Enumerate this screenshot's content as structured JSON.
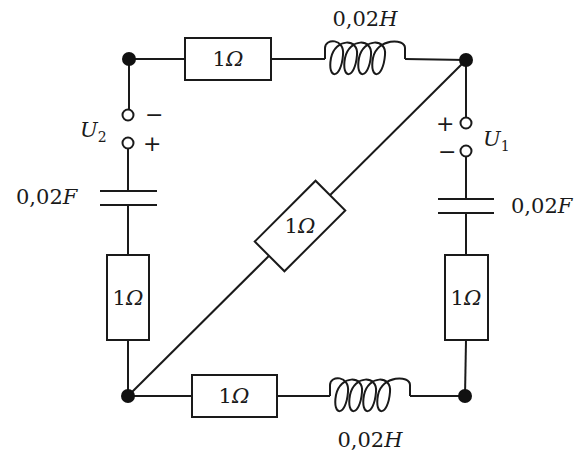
{
  "diagram": {
    "type": "electrical-circuit",
    "nodes": [
      {
        "id": "top-left",
        "x": 129,
        "y": 59
      },
      {
        "id": "top-right",
        "x": 466,
        "y": 60
      },
      {
        "id": "bottom-left",
        "x": 128,
        "y": 396
      },
      {
        "id": "bottom-right",
        "x": 465,
        "y": 396
      }
    ],
    "top_branch": {
      "resistor": {
        "value": "1",
        "unit": "Ω"
      },
      "inductor": {
        "label": "0,02",
        "unit": "H"
      }
    },
    "bottom_branch": {
      "resistor": {
        "value": "1",
        "unit": "Ω"
      },
      "inductor": {
        "label": "0,02",
        "unit": "H"
      }
    },
    "left_branch": {
      "source": {
        "name": "U",
        "sub": "2",
        "top_sign": "−",
        "bottom_sign": "+"
      },
      "capacitor": {
        "label": "0,02",
        "unit": "F"
      },
      "resistor": {
        "value": "1",
        "unit": "Ω"
      }
    },
    "right_branch": {
      "source": {
        "name": "U",
        "sub": "1",
        "top_sign": "+",
        "bottom_sign": "−"
      },
      "capacitor": {
        "label": "0,02",
        "unit": "F"
      },
      "resistor": {
        "value": "1",
        "unit": "Ω"
      }
    },
    "diagonal_branch": {
      "resistor": {
        "value": "1",
        "unit": "Ω"
      }
    }
  },
  "colors": {
    "line": "#1a1a1a",
    "background": "#ffffff"
  }
}
